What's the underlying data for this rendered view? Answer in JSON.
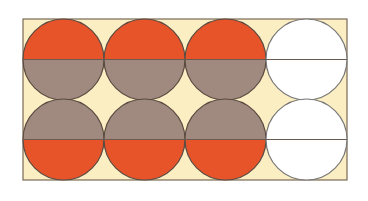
{
  "diagram": {
    "type": "fraction-circles",
    "colors": {
      "background": "#ffffff",
      "rectangle_fill": "#fbeec3",
      "rectangle_stroke": "#7a6a55",
      "orange": "#e8542a",
      "gray": "#a08a80",
      "white": "#ffffff",
      "circle_stroke": "#5a4a40",
      "divider_stroke": "#6a5a50"
    },
    "rectangle": {
      "x": 23,
      "y": 19,
      "width": 324,
      "height": 161
    },
    "radius": 40.5,
    "rows": [
      {
        "cy": 59.5,
        "circles": [
          {
            "cx": 63.5,
            "top": "orange",
            "bottom": "gray"
          },
          {
            "cx": 144.5,
            "top": "orange",
            "bottom": "gray"
          },
          {
            "cx": 225.5,
            "top": "orange",
            "bottom": "gray"
          },
          {
            "cx": 306.5,
            "top": "white",
            "bottom": "white"
          }
        ]
      },
      {
        "cy": 139.5,
        "circles": [
          {
            "cx": 63.5,
            "top": "gray",
            "bottom": "orange"
          },
          {
            "cx": 144.5,
            "top": "gray",
            "bottom": "orange"
          },
          {
            "cx": 225.5,
            "top": "gray",
            "bottom": "orange"
          },
          {
            "cx": 306.5,
            "top": "white",
            "bottom": "white"
          }
        ]
      }
    ],
    "summary": {
      "total_circles": 8,
      "orange_halves": 6,
      "gray_halves": 6,
      "white_halves": 4
    }
  }
}
